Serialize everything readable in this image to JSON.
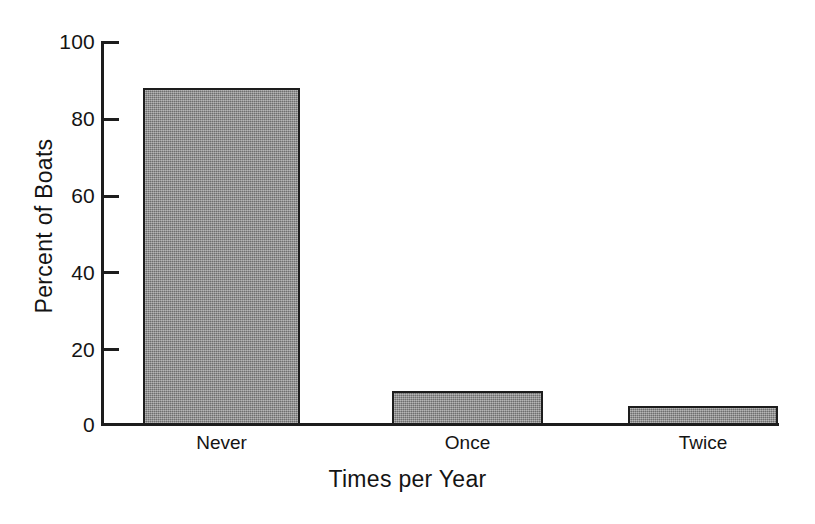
{
  "chart_data": {
    "type": "bar",
    "title": "",
    "subtitle": "",
    "xlabel": "Times per Year",
    "ylabel": "Percent of Boats",
    "categories": [
      "Never",
      "Once",
      "Twice"
    ],
    "values": [
      88,
      9,
      5
    ],
    "series": [
      {
        "name": "Percent of Boats",
        "values": [
          88,
          9,
          5
        ]
      }
    ],
    "ylim": [
      0,
      100
    ],
    "yticks": [
      0,
      20,
      40,
      60,
      80,
      100
    ],
    "ytick_labels": [
      "0",
      "20",
      "40",
      "60",
      "80",
      "100"
    ],
    "grid": false,
    "legend": false,
    "legend_position": "none",
    "bar_fill_color": "#8d8d8d",
    "bar_edge_color": "#1d1d1d",
    "background_color": "#ffffff",
    "annotations": []
  },
  "axis": {
    "y_title": "Percent of Boats",
    "x_title": "Times per Year",
    "ticks": [
      {
        "label": "100",
        "value": 100
      },
      {
        "label": "80",
        "value": 80
      },
      {
        "label": "60",
        "value": 60
      },
      {
        "label": "40",
        "value": 40
      },
      {
        "label": "20",
        "value": 20
      },
      {
        "label": "0",
        "value": 0
      }
    ]
  },
  "bars": [
    {
      "label": "Never",
      "value": 88
    },
    {
      "label": "Once",
      "value": 9
    },
    {
      "label": "Twice",
      "value": 5
    }
  ]
}
